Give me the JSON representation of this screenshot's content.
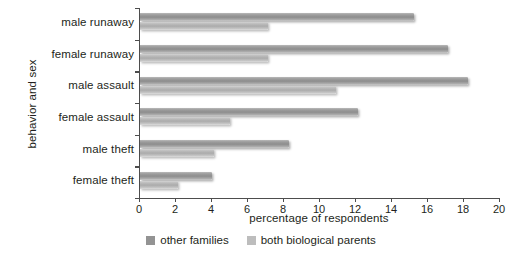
{
  "chart_data": {
    "type": "bar",
    "orientation": "horizontal",
    "title": "",
    "xlabel": "percentage of respondents",
    "ylabel": "behavior and sex",
    "categories": [
      "male runaway",
      "female runaway",
      "male assault",
      "female assault",
      "male theft",
      "female theft"
    ],
    "series": [
      {
        "name": "other families",
        "color": "#939393",
        "values": [
          15.2,
          17.1,
          18.2,
          12.1,
          8.3,
          4.0
        ]
      },
      {
        "name": "both biological parents",
        "color": "#bdbdbd",
        "values": [
          7.1,
          7.1,
          10.9,
          5.0,
          4.1,
          2.1
        ]
      }
    ],
    "xlim": [
      0,
      20
    ],
    "xticks": [
      0,
      2,
      4,
      6,
      8,
      10,
      12,
      14,
      16,
      18,
      20
    ],
    "xtick_labels": [
      "0",
      "2",
      "4",
      "6",
      "8",
      "10",
      "12",
      "14",
      "16",
      "18",
      "20"
    ],
    "grid": false,
    "legend_position": "bottom-center"
  },
  "legend": {
    "items": [
      {
        "label": "other families",
        "swatch": "dark"
      },
      {
        "label": "both biological parents",
        "swatch": "light"
      }
    ]
  }
}
